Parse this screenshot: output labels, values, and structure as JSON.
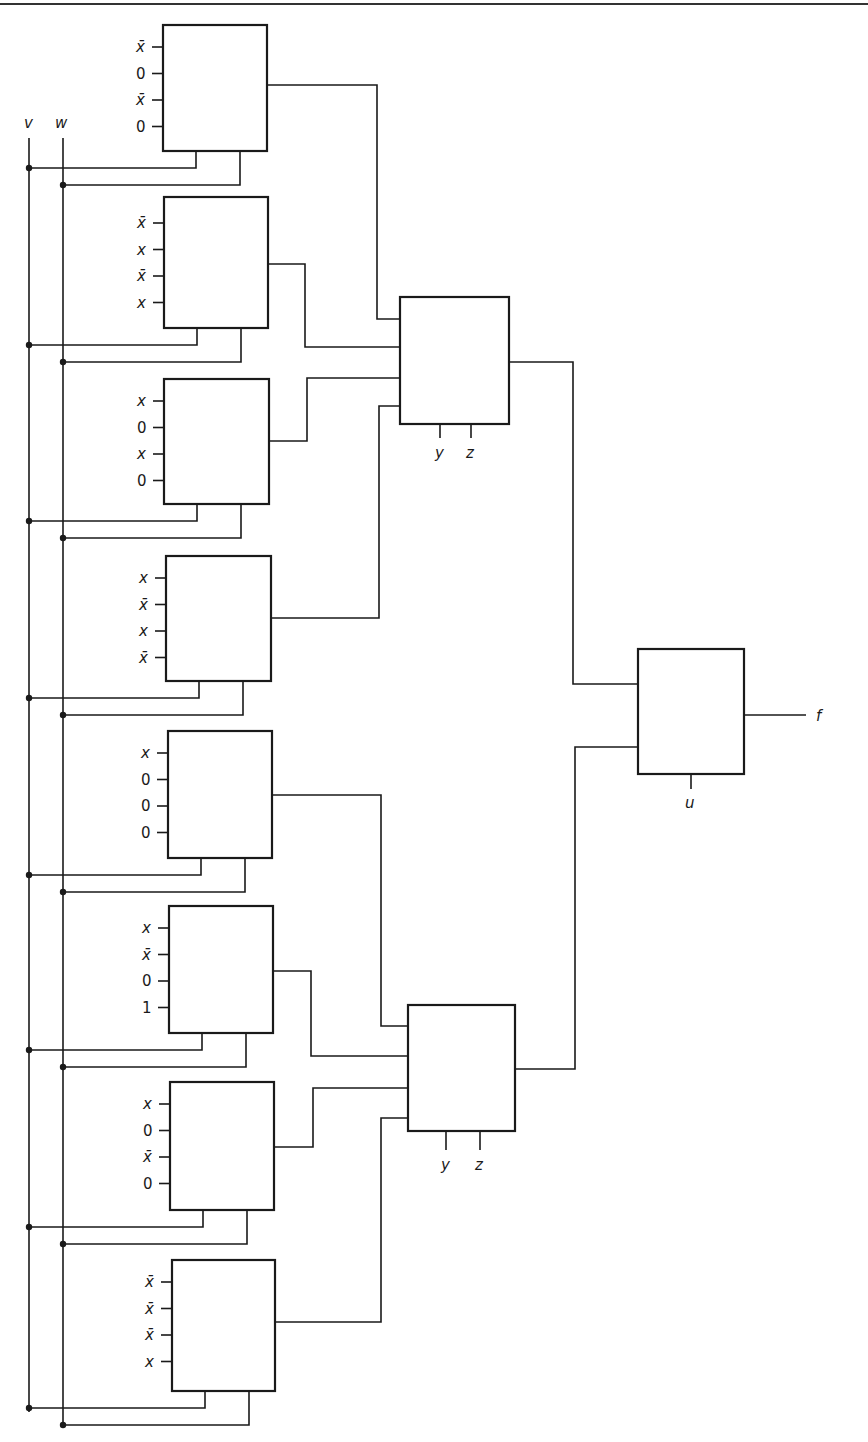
{
  "diagram": {
    "title": "",
    "colors": {
      "line": "#1a1a1a",
      "background": "#ffffff"
    },
    "select_inputs": {
      "v": "v",
      "w": "w"
    },
    "first_level_muxes": [
      {
        "id": "m1",
        "inputs": [
          "x̄",
          "0",
          "x̄",
          "0"
        ]
      },
      {
        "id": "m2",
        "inputs": [
          "x̄",
          "x",
          "x̄",
          "x"
        ]
      },
      {
        "id": "m3",
        "inputs": [
          "x",
          "0",
          "x",
          "0"
        ]
      },
      {
        "id": "m4",
        "inputs": [
          "x",
          "x̄",
          "x",
          "x̄"
        ]
      },
      {
        "id": "m5",
        "inputs": [
          "x",
          "0",
          "0",
          "0"
        ]
      },
      {
        "id": "m6",
        "inputs": [
          "x",
          "x̄",
          "0",
          "1"
        ]
      },
      {
        "id": "m7",
        "inputs": [
          "x",
          "0",
          "x̄",
          "0"
        ]
      },
      {
        "id": "m8",
        "inputs": [
          "x̄",
          "x̄",
          "x̄",
          "x"
        ]
      }
    ],
    "second_level_muxes": [
      {
        "id": "m9",
        "selects": [
          "y",
          "z"
        ]
      },
      {
        "id": "m10",
        "selects": [
          "y",
          "z"
        ]
      }
    ],
    "output_mux": {
      "id": "m11",
      "select": "u",
      "output": "f"
    }
  }
}
